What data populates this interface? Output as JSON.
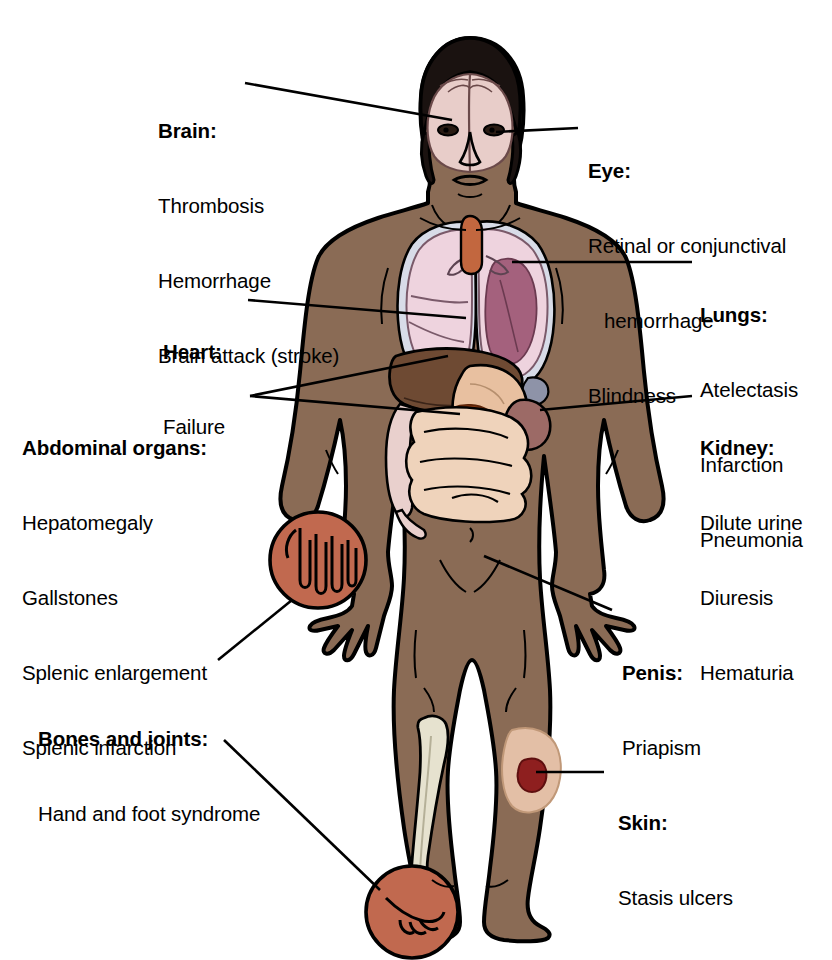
{
  "diagram": {
    "background_color": "#ffffff",
    "colors": {
      "skin": "#8a6b55",
      "skin_shadow": "#7a5c47",
      "outline": "#000000",
      "brain": "#e8cdc9",
      "lung_pale": "#eed3de",
      "lung_infarct": "#a4617d",
      "pleura": "#d8dce8",
      "liver": "#6e4a33",
      "stomach": "#e8c0a0",
      "intestine": "#efd3bb",
      "spleen": "#9c6a66",
      "bone": "#e6e2cf",
      "joint_circle": "#c1694f",
      "ulcer_patch": "#e3bfa6",
      "ulcer_center": "#8e1f1f",
      "trachea": "#c2673f",
      "leader_line": "#000000"
    }
  },
  "callouts": [
    {
      "id": "brain",
      "title": "Brain:",
      "lines": [
        "Thrombosis",
        "Hemorrhage",
        "Brain attack (stroke)"
      ],
      "side": "left",
      "target": "brain-region"
    },
    {
      "id": "eye",
      "title": "Eye:",
      "lines": [
        "Retinal or conjunctival",
        "hemorrhage",
        "Blindness"
      ],
      "indented": [
        false,
        true,
        false
      ],
      "side": "right",
      "target": "eye-region"
    },
    {
      "id": "lungs",
      "title": "Lungs:",
      "lines": [
        "Atelectasis",
        "Infarction",
        "Pneumonia"
      ],
      "side": "right",
      "target": "lung-region"
    },
    {
      "id": "heart",
      "title": "Heart:",
      "lines": [
        "Failure"
      ],
      "side": "left",
      "target": "heart-region"
    },
    {
      "id": "abdominal-organs",
      "title": "Abdominal organs:",
      "lines": [
        "Hepatomegaly",
        "Gallstones",
        "Splenic enlargement",
        "Splenic infarction"
      ],
      "side": "left",
      "target": "liver-and-spleen-region"
    },
    {
      "id": "kidney",
      "title": "Kidney:",
      "lines": [
        "Dilute urine",
        "Diuresis",
        "Hematuria"
      ],
      "side": "right",
      "target": "kidney-region"
    },
    {
      "id": "penis",
      "title": "Penis:",
      "lines": [
        "Priapism"
      ],
      "side": "right",
      "target": "groin-region"
    },
    {
      "id": "bones-and-joints",
      "title": "Bones and joints:",
      "lines": [
        "Hand and foot syndrome"
      ],
      "side": "left",
      "target": "hand-and-foot-circles"
    },
    {
      "id": "skin",
      "title": "Skin:",
      "lines": [
        "Stasis ulcers"
      ],
      "side": "right",
      "target": "lower-leg-ulcer"
    }
  ]
}
